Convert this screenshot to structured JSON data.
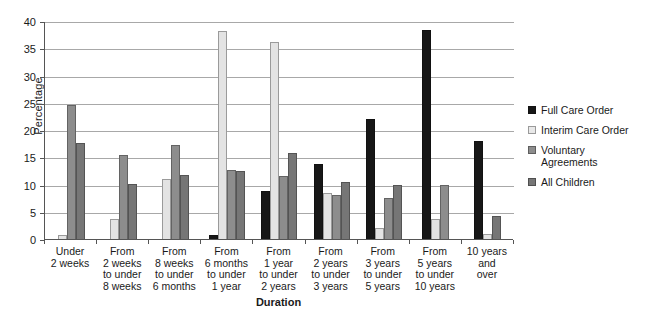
{
  "chart_data": {
    "type": "bar",
    "title": "",
    "xlabel": "Duration",
    "ylabel": "Percentage",
    "ylim": [
      0,
      40
    ],
    "ytick_step": 5,
    "yticks": [
      0,
      5,
      10,
      15,
      20,
      25,
      30,
      35,
      40
    ],
    "grid": true,
    "legend_position": "right",
    "categories": [
      "Under\n2 weeks",
      "From\n2 weeks\nto under\n8 weeks",
      "From\n8 weeks\nto under\n6 months",
      "From\n6 months\nto under\n1 year",
      "From\n1 year\nto under\n2 years",
      "From\n2 years\nto under\n3 years",
      "From\n3 years\nto under\n5 years",
      "From\n5 years\nto under\n10 years",
      "10 years\nand\nover"
    ],
    "series": [
      {
        "name": "Full Care Order",
        "color": "#171717",
        "values": [
          0,
          0,
          0,
          0.7,
          8.8,
          13.8,
          22.0,
          38.4,
          18.0
        ]
      },
      {
        "name": "Interim Care Order",
        "color": "#e3e3e3",
        "values": [
          0.8,
          3.7,
          11.0,
          38.1,
          36.1,
          8.4,
          2.0,
          3.7,
          0.9
        ]
      },
      {
        "name": "Voluntary\nAgreements",
        "color": "#8d8d8d",
        "values": [
          24.5,
          15.4,
          17.2,
          12.7,
          11.6,
          8.1,
          7.5,
          10.0,
          0
        ]
      },
      {
        "name": "All Children",
        "color": "#767676",
        "values": [
          17.7,
          10.1,
          11.8,
          12.5,
          15.8,
          10.5,
          10.0,
          0,
          4.3
        ]
      }
    ]
  }
}
